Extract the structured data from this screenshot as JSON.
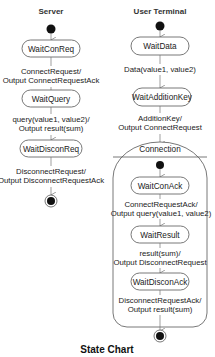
{
  "title": "State Chart",
  "server": {
    "header": "Server",
    "states": [
      "WaitConReq",
      "WaitQuery",
      "WaitDisconReq"
    ],
    "transitions": [
      {
        "line1": "ConnectRequest/",
        "line2": "Output ConnectRequestAck"
      },
      {
        "line1": "query(value1, value2)/",
        "line2": "Output result(sum)"
      },
      {
        "line1": "DisconnectRequest/",
        "line2": "Output DisconnectRequestAck"
      }
    ]
  },
  "terminal": {
    "header": "User Terminal",
    "states": [
      "WaitData",
      "WaitAdditionKey"
    ],
    "transitions": [
      {
        "line1": "Data(value1, value2)",
        "line2": ""
      },
      {
        "line1": "AdditionKey/",
        "line2": "Output ConnectRequest"
      }
    ],
    "composite": {
      "name": "Connection",
      "states": [
        "WaitConAck",
        "WaitResult",
        "WaitDisconAck"
      ],
      "transitions": [
        {
          "line1": "ConnectRequestAck/",
          "line2": "Output query(value1, value2)"
        },
        {
          "line1": "result(sum)/",
          "line2": "Output DisconnectRequest"
        },
        {
          "line1": "DisconnectRequestAck/",
          "line2": "Output result(sum)"
        }
      ]
    }
  }
}
